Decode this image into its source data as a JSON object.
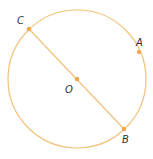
{
  "diagram": {
    "type": "circle-geometry",
    "stroke_color": "#f2c27a",
    "point_color": "#f0a84a",
    "label_color": "#2a2f3a",
    "circle": {
      "cx": 77,
      "cy": 79,
      "r": 69
    },
    "diameter": {
      "from": "C",
      "to": "B",
      "through": "O"
    },
    "points": [
      {
        "name": "C",
        "label": "C",
        "x": 29,
        "y": 29,
        "lx": 17,
        "ly": 24
      },
      {
        "name": "A",
        "label": "A",
        "x": 139,
        "y": 52,
        "lx": 136,
        "ly": 46
      },
      {
        "name": "O",
        "label": "O",
        "x": 77,
        "y": 79,
        "lx": 65,
        "ly": 93
      },
      {
        "name": "B",
        "label": "B",
        "x": 124,
        "y": 129,
        "lx": 122,
        "ly": 143
      }
    ]
  }
}
